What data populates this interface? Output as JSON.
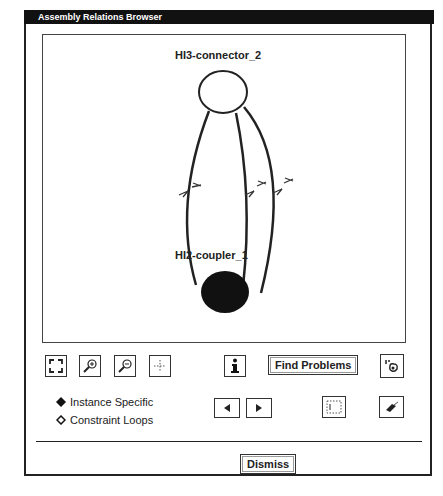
{
  "window": {
    "title": "Assembly Relations Browser"
  },
  "graph": {
    "nodes": [
      {
        "id": "top",
        "label": "HI3-connector_2",
        "filled": false
      },
      {
        "id": "bottom",
        "label": "HI2-coupler_1",
        "filled": true
      }
    ],
    "edges": 3
  },
  "toolbar": {
    "fit_icon": "fit-view-icon",
    "zoom_in_icon": "zoom-in-icon",
    "zoom_out_icon": "zoom-out-icon",
    "pan_icon": "crosshair-icon",
    "info_icon": "info-icon",
    "find_problems_label": "Find Problems",
    "highlight_icon": "highlight-icon"
  },
  "mode": {
    "options": [
      {
        "label": "Instance Specific",
        "selected": true
      },
      {
        "label": "Constraint Loops",
        "selected": false
      }
    ]
  },
  "nav": {
    "prev_icon": "prev-arrow-icon",
    "next_icon": "next-arrow-icon",
    "select_icon": "select-region-icon",
    "eraser_icon": "eraser-icon"
  },
  "footer": {
    "dismiss_label": "Dismiss"
  }
}
